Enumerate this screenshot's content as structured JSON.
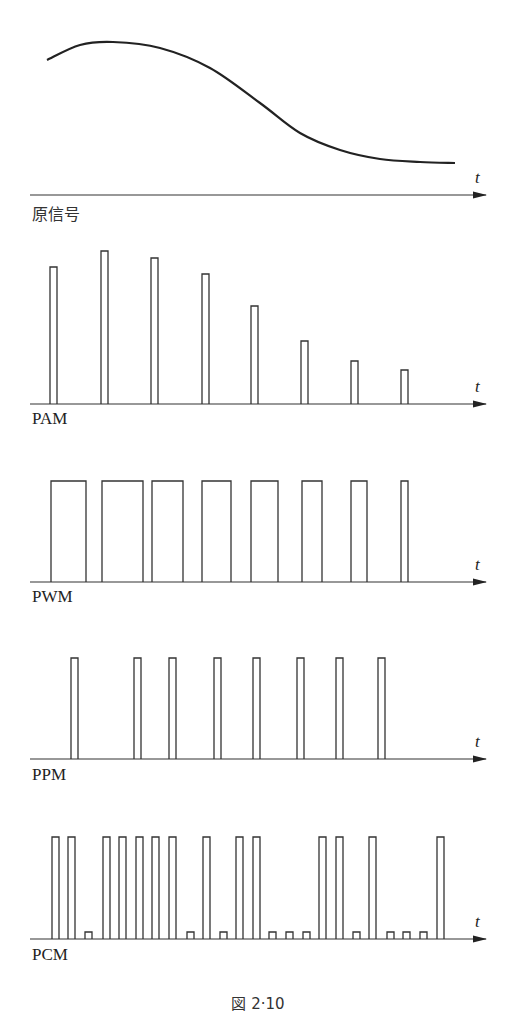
{
  "figure": {
    "caption": "図 2·10",
    "axis_label": "t"
  },
  "panels": {
    "original": {
      "label": "原信号"
    },
    "pam": {
      "label": "PAM"
    },
    "pwm": {
      "label": "PWM"
    },
    "ppm": {
      "label": "PPM"
    },
    "pcm": {
      "label": "PCM"
    }
  },
  "chart_data": [
    {
      "type": "line",
      "title": "原信号",
      "xlabel": "t",
      "description": "Smooth analog signal: rises to a peak near the start, then decays to a low plateau",
      "points": [
        [
          47,
          60
        ],
        [
          80,
          45
        ],
        [
          113,
          42
        ],
        [
          160,
          48
        ],
        [
          210,
          68
        ],
        [
          260,
          103
        ],
        [
          300,
          133
        ],
        [
          340,
          150
        ],
        [
          380,
          159
        ],
        [
          420,
          162
        ],
        [
          455,
          163
        ]
      ]
    },
    {
      "type": "bar",
      "title": "PAM",
      "xlabel": "t",
      "description": "Pulse amplitude modulation: fixed-width narrow pulses, height follows signal",
      "categories": [
        1,
        2,
        3,
        4,
        5,
        6,
        7,
        8
      ],
      "values": [
        137,
        153,
        146,
        130,
        98,
        63,
        43,
        34
      ],
      "x_positions": [
        50,
        101,
        151,
        202,
        251,
        301,
        351,
        401
      ],
      "pulse_width": 7
    },
    {
      "type": "bar",
      "title": "PWM",
      "xlabel": "t",
      "description": "Pulse width modulation: constant height, width follows signal",
      "categories": [
        1,
        2,
        3,
        4,
        5,
        6,
        7,
        8
      ],
      "starts": [
        51,
        102,
        152,
        202,
        251,
        302,
        351,
        401
      ],
      "widths": [
        35,
        41,
        31,
        29,
        27,
        20,
        16,
        7
      ],
      "height": 101
    },
    {
      "type": "bar",
      "title": "PPM",
      "xlabel": "t",
      "description": "Pulse position modulation: constant height and width, position varies",
      "categories": [
        1,
        2,
        3,
        4,
        5,
        6,
        7,
        8
      ],
      "x_positions": [
        71,
        134,
        169,
        214,
        253,
        297,
        336,
        378
      ],
      "pulse_width": 7,
      "height": 101
    },
    {
      "type": "bar",
      "title": "PCM",
      "xlabel": "t",
      "description": "Pulse code modulation: 3-bit codes per sample (1 = tall pulse, 0 = small pulse)",
      "bits": [
        1,
        1,
        0,
        1,
        1,
        1,
        1,
        1,
        0,
        1,
        0,
        1,
        1,
        0,
        0,
        0,
        1,
        1,
        0,
        1,
        0,
        0,
        0,
        1
      ],
      "x_positions": [
        52,
        68,
        85,
        103,
        119,
        136,
        152,
        169,
        187,
        203,
        220,
        236,
        253,
        269,
        286,
        303,
        319,
        336,
        353,
        369,
        387,
        403,
        420,
        437
      ],
      "pulse_width": 7,
      "tall_height": 102,
      "short_height": 7
    }
  ]
}
